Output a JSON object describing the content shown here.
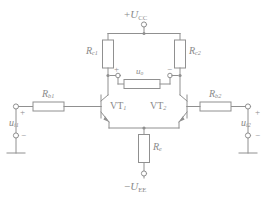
{
  "diagram": {
    "stroke_color": "#909090",
    "label_color": "#8a8a8a",
    "background": "#ffffff"
  },
  "supplies": {
    "positive": {
      "sign": "+",
      "symbol": "U",
      "subscript": "CC",
      "text": "+U_CC"
    },
    "negative": {
      "sign": "−",
      "symbol": "U",
      "subscript": "EE",
      "text": "−U_EE"
    }
  },
  "resistors": [
    {
      "id": "rc1",
      "symbol": "R",
      "subscript": "c1",
      "name": "collector-resistor-1"
    },
    {
      "id": "rc2",
      "symbol": "R",
      "subscript": "c2",
      "name": "collector-resistor-2"
    },
    {
      "id": "rb1",
      "symbol": "R",
      "subscript": "b1",
      "name": "base-resistor-1"
    },
    {
      "id": "rb2",
      "symbol": "R",
      "subscript": "b2",
      "name": "base-resistor-2"
    },
    {
      "id": "re",
      "symbol": "R",
      "subscript": "e",
      "name": "emitter-resistor"
    },
    {
      "id": "rl",
      "symbol": "",
      "subscript": "",
      "name": "output-load-resistor"
    }
  ],
  "transistors": [
    {
      "id": "vt1",
      "symbol": "VT",
      "subscript": "1",
      "type": "NPN"
    },
    {
      "id": "vt2",
      "symbol": "VT",
      "subscript": "2",
      "type": "NPN"
    }
  ],
  "signals": {
    "input_left": {
      "symbol": "u",
      "subscript": "i1",
      "plus": "+",
      "minus": "−"
    },
    "input_right": {
      "symbol": "u",
      "subscript": "i2",
      "plus": "+",
      "minus": "−"
    },
    "output": {
      "symbol": "u",
      "subscript": "o",
      "plus": "+",
      "minus": "−"
    }
  },
  "grounds": [
    {
      "id": "gnd-left",
      "name": "ground-left"
    },
    {
      "id": "gnd-right",
      "name": "ground-right"
    }
  ]
}
